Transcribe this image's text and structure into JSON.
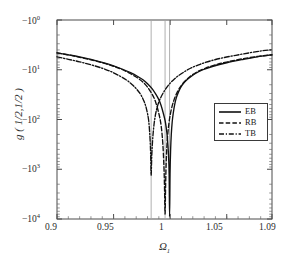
{
  "chart_data": {
    "type": "line",
    "title": "",
    "xlabel": "Ω₁",
    "ylabel": "g ( 1/2,1/2 )",
    "xlim": [
      0.9,
      1.09
    ],
    "ylim_note": "negative logarithmic axis, -10^0 at top to -10^4 at bottom",
    "yscale": "negative-log",
    "grid": false,
    "legend_position": "center-right",
    "xticks": [
      0.9,
      0.95,
      1,
      1.05,
      1.09
    ],
    "xtick_labels": [
      "0.9",
      "0.95",
      "1",
      "1.05",
      "1.09"
    ],
    "ytick_exponents": [
      0,
      1,
      2,
      3,
      4
    ],
    "ytick_labels": [
      "-10",
      "-10",
      "-10",
      "-10",
      "-10"
    ],
    "ytick_superscripts": [
      "0",
      "1",
      "2",
      "3",
      "4"
    ],
    "resonance_lines": [
      0.9832,
      0.9955,
      0.9995
    ],
    "series": [
      {
        "name": "EB",
        "style": "solid",
        "dip_x": 0.9995,
        "dip_y_exponent": 3.95,
        "x": [
          0.9,
          0.91,
          0.92,
          0.93,
          0.94,
          0.95,
          0.958,
          0.965,
          0.971,
          0.976,
          0.98,
          0.984,
          0.987,
          0.99,
          0.992,
          0.994,
          0.9955,
          0.9965,
          0.9975,
          0.9985,
          0.9991,
          0.9995,
          0.9999,
          1.0004,
          1.001,
          1.0018,
          1.0028,
          1.004,
          1.0055,
          1.0075,
          1.01,
          1.013,
          1.017,
          1.022,
          1.029,
          1.038,
          1.05,
          1.065,
          1.079,
          1.09
        ],
        "y_exp": [
          0.66,
          0.7,
          0.74,
          0.79,
          0.85,
          0.92,
          0.99,
          1.06,
          1.13,
          1.2,
          1.28,
          1.38,
          1.48,
          1.6,
          1.72,
          1.88,
          2.02,
          2.16,
          2.36,
          2.7,
          3.1,
          3.95,
          3.1,
          2.62,
          2.3,
          2.05,
          1.86,
          1.7,
          1.56,
          1.44,
          1.33,
          1.24,
          1.16,
          1.08,
          1.0,
          0.93,
          0.86,
          0.79,
          0.73,
          0.7
        ]
      },
      {
        "name": "RB",
        "style": "dashed",
        "dip_x": 0.9955,
        "dip_y_exponent": 3.9,
        "x": [
          0.9,
          0.91,
          0.92,
          0.93,
          0.94,
          0.95,
          0.958,
          0.965,
          0.971,
          0.976,
          0.98,
          0.984,
          0.987,
          0.99,
          0.992,
          0.9935,
          0.9945,
          0.995,
          0.9955,
          0.996,
          0.9966,
          0.9975,
          0.999,
          1.001,
          1.0035,
          1.0065,
          1.01,
          1.014,
          1.0185,
          1.024,
          1.031,
          1.04,
          1.051,
          1.064,
          1.078,
          1.09
        ],
        "y_exp": [
          0.66,
          0.7,
          0.75,
          0.8,
          0.86,
          0.93,
          1.0,
          1.08,
          1.16,
          1.25,
          1.35,
          1.49,
          1.64,
          1.88,
          2.12,
          2.48,
          2.95,
          3.35,
          3.9,
          3.3,
          2.8,
          2.4,
          2.06,
          1.8,
          1.6,
          1.44,
          1.31,
          1.21,
          1.12,
          1.04,
          0.97,
          0.9,
          0.84,
          0.78,
          0.73,
          0.7
        ]
      },
      {
        "name": "TB",
        "style": "dashdot",
        "dip_x": 0.9832,
        "dip_y_exponent": 3.12,
        "x": [
          0.9,
          0.91,
          0.92,
          0.93,
          0.94,
          0.948,
          0.955,
          0.961,
          0.966,
          0.97,
          0.974,
          0.977,
          0.979,
          0.981,
          0.9822,
          0.9828,
          0.9832,
          0.9838,
          0.9848,
          0.9862,
          0.988,
          0.9905,
          0.994,
          0.9985,
          1.004,
          1.0105,
          1.018,
          1.0265,
          1.036,
          1.0465,
          1.058,
          1.07,
          1.081,
          1.09
        ],
        "y_exp": [
          0.74,
          0.79,
          0.84,
          0.9,
          0.97,
          1.04,
          1.12,
          1.2,
          1.29,
          1.38,
          1.5,
          1.64,
          1.78,
          2.02,
          2.38,
          2.72,
          3.12,
          2.7,
          2.32,
          2.02,
          1.8,
          1.62,
          1.46,
          1.31,
          1.18,
          1.07,
          0.97,
          0.89,
          0.82,
          0.76,
          0.71,
          0.66,
          0.62,
          0.6
        ]
      }
    ]
  },
  "legend": {
    "items": [
      {
        "label": "EB",
        "style": "solid"
      },
      {
        "label": "RB",
        "style": "dashed"
      },
      {
        "label": "TB",
        "style": "dashdot"
      }
    ]
  },
  "axes": {
    "y_prefix": "−",
    "y_base": "10",
    "x_axis_title": "Ω",
    "x_axis_subscript": "1",
    "y_axis_title": "g ( 1/2,1/2 )"
  }
}
